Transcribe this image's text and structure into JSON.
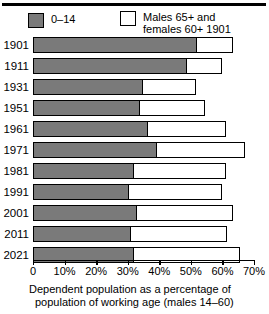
{
  "chart_data": {
    "type": "bar",
    "orientation": "horizontal",
    "stacked": true,
    "title": "",
    "caption_line_1": "Dependent population as a percentage of",
    "caption_line_2": "population of working age   (males 14–60)",
    "xlabel": "",
    "ylabel": "",
    "xlim": [
      0,
      70
    ],
    "grid": false,
    "legend_position": "top",
    "categories": [
      "1901",
      "1911",
      "1931",
      "1951",
      "1961",
      "1971",
      "1981",
      "1991",
      "2001",
      "2011",
      "2021"
    ],
    "x_tick_values": [
      0,
      10,
      20,
      30,
      40,
      50,
      60,
      70
    ],
    "x_tick_labels": [
      "0",
      "10%",
      "20%",
      "30%",
      "40%",
      "50%",
      "60%",
      "70%"
    ],
    "series": [
      {
        "name": "0–14",
        "color": "#7a7a7a",
        "values": [
          52,
          49,
          35,
          34,
          36.5,
          39.5,
          32,
          30.5,
          33,
          31,
          32
        ]
      },
      {
        "name": "Males 65+ and females 60+ 1901",
        "color": "#ffffff",
        "values": [
          11.5,
          11,
          16.5,
          20.5,
          24.5,
          27.5,
          29,
          29.5,
          30.5,
          30.5,
          33.5
        ]
      }
    ],
    "totals": [
      63.5,
      60,
      51.5,
      54.5,
      61,
      67,
      61,
      60,
      63.5,
      61.5,
      65.5
    ]
  },
  "legend": {
    "entries": [
      {
        "label": "0–14",
        "swatch": "filled"
      },
      {
        "label": "Males 65+ and\nfemales 60+ 1901",
        "swatch": "hollow"
      }
    ]
  }
}
